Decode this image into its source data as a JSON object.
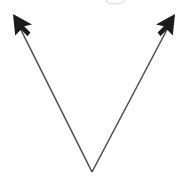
{
  "figure": {
    "name": "angle-diagram",
    "background_color": "#ffffff",
    "width": 191,
    "height": 176,
    "line_color": "#4a4a4a",
    "arrow_color": "#1c1c1c",
    "line_width": 1.5,
    "vertex": {
      "label": "vertex",
      "x": 92,
      "y": 172
    },
    "rays": [
      {
        "name": "left-ray",
        "label": "left ray",
        "direction": "up-left",
        "from_x": 92,
        "from_y": 172,
        "to_x": 17,
        "to_y": 22,
        "arrow_tip_x": 13,
        "arrow_tip_y": 14
      },
      {
        "name": "right-ray",
        "label": "right ray",
        "direction": "up-right",
        "from_x": 92,
        "from_y": 172,
        "to_x": 171,
        "to_y": 22,
        "arrow_tip_x": 175,
        "arrow_tip_y": 14
      }
    ],
    "arrowheads": [
      {
        "name": "left-arrowhead",
        "style": "solid-barbed",
        "points": "13,14 15.2,35.5 21.0,29.6 27.5,36.2 30.4,32.6 24.2,26.2 32.0,24.5"
      },
      {
        "name": "right-arrowhead",
        "style": "solid-barbed",
        "points": "175,14 172.8,35.5 167.0,29.6 160.5,36.2 157.6,32.6 163.8,26.2 156.0,24.5"
      }
    ],
    "artifact": {
      "name": "clipped-edge-artifact",
      "visible": true,
      "color": "#d8d8d8",
      "x": 115,
      "y": 1,
      "rx": 9,
      "ry": 3
    }
  }
}
